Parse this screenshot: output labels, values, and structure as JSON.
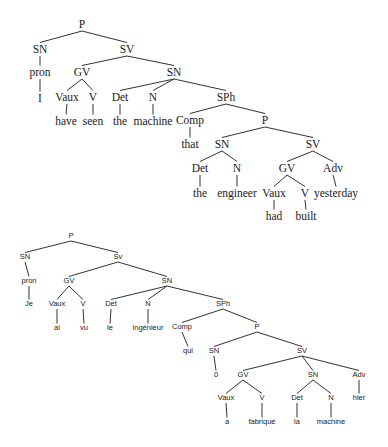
{
  "trees": [
    {
      "id": "english",
      "style": "t1",
      "sentence": "I have seen the machine that the engineer had built yesterday",
      "nodes": [
        {
          "id": "P",
          "label": "P",
          "x": 82,
          "y": 28
        },
        {
          "id": "SN1",
          "label": "SN",
          "x": 40,
          "y": 53
        },
        {
          "id": "SV1",
          "label": "SV",
          "x": 127,
          "y": 53
        },
        {
          "id": "pron",
          "label": "pron",
          "x": 40,
          "y": 76
        },
        {
          "id": "I",
          "label": "I",
          "x": 40,
          "y": 102
        },
        {
          "id": "GV1",
          "label": "GV",
          "x": 82,
          "y": 76
        },
        {
          "id": "SN2",
          "label": "SN",
          "x": 174,
          "y": 76
        },
        {
          "id": "Vaux1",
          "label": "Vaux",
          "x": 67,
          "y": 101
        },
        {
          "id": "V1",
          "label": "V",
          "x": 93,
          "y": 101
        },
        {
          "id": "Det1",
          "label": "Det",
          "x": 120,
          "y": 101
        },
        {
          "id": "N1",
          "label": "N",
          "x": 153,
          "y": 101
        },
        {
          "id": "SPh",
          "label": "SPh",
          "x": 226,
          "y": 101
        },
        {
          "id": "have",
          "label": "have",
          "x": 66,
          "y": 125
        },
        {
          "id": "seen",
          "label": "seen",
          "x": 93,
          "y": 125
        },
        {
          "id": "the1",
          "label": "the",
          "x": 120,
          "y": 125
        },
        {
          "id": "machine",
          "label": "machine",
          "x": 153,
          "y": 125
        },
        {
          "id": "Comp",
          "label": "Comp",
          "x": 190,
          "y": 124
        },
        {
          "id": "P2",
          "label": "P",
          "x": 265,
          "y": 124
        },
        {
          "id": "that",
          "label": "that",
          "x": 190,
          "y": 148
        },
        {
          "id": "SN3",
          "label": "SN",
          "x": 222,
          "y": 148
        },
        {
          "id": "SV2",
          "label": "SV",
          "x": 313,
          "y": 148
        },
        {
          "id": "Det2",
          "label": "Det",
          "x": 200,
          "y": 172
        },
        {
          "id": "N2",
          "label": "N",
          "x": 237,
          "y": 172
        },
        {
          "id": "GV2",
          "label": "GV",
          "x": 287,
          "y": 172
        },
        {
          "id": "Adv",
          "label": "Adv",
          "x": 333,
          "y": 172
        },
        {
          "id": "the2",
          "label": "the",
          "x": 200,
          "y": 197
        },
        {
          "id": "engineer",
          "label": "engineer",
          "x": 237,
          "y": 197
        },
        {
          "id": "Vaux2",
          "label": "Vaux",
          "x": 274,
          "y": 197
        },
        {
          "id": "V2",
          "label": "V",
          "x": 305,
          "y": 197
        },
        {
          "id": "yesterday",
          "label": "yesterday",
          "x": 336,
          "y": 197
        },
        {
          "id": "had",
          "label": "had",
          "x": 274,
          "y": 220
        },
        {
          "id": "built",
          "label": "built",
          "x": 306,
          "y": 220
        }
      ],
      "edges": [
        [
          "P",
          "SN1"
        ],
        [
          "P",
          "SV1"
        ],
        [
          "SN1",
          "pron"
        ],
        [
          "pron",
          "I"
        ],
        [
          "SV1",
          "GV1"
        ],
        [
          "SV1",
          "SN2"
        ],
        [
          "GV1",
          "Vaux1"
        ],
        [
          "GV1",
          "V1"
        ],
        [
          "Vaux1",
          "have"
        ],
        [
          "V1",
          "seen"
        ],
        [
          "SN2",
          "Det1"
        ],
        [
          "SN2",
          "N1"
        ],
        [
          "SN2",
          "SPh"
        ],
        [
          "Det1",
          "the1"
        ],
        [
          "N1",
          "machine"
        ],
        [
          "SPh",
          "Comp"
        ],
        [
          "SPh",
          "P2"
        ],
        [
          "Comp",
          "that"
        ],
        [
          "P2",
          "SN3"
        ],
        [
          "P2",
          "SV2"
        ],
        [
          "SN3",
          "Det2"
        ],
        [
          "SN3",
          "N2"
        ],
        [
          "Det2",
          "the2"
        ],
        [
          "N2",
          "engineer"
        ],
        [
          "SV2",
          "GV2"
        ],
        [
          "SV2",
          "Adv"
        ],
        [
          "GV2",
          "Vaux2"
        ],
        [
          "GV2",
          "V2"
        ],
        [
          "Vaux2",
          "had"
        ],
        [
          "V2",
          "built"
        ],
        [
          "Adv",
          "yesterday"
        ]
      ]
    },
    {
      "id": "french",
      "style": "t2",
      "sentence": "Je ai vu le ingénieur qui 0 a fabriqué la machine hier",
      "nodes": [
        {
          "id": "P",
          "label": "P",
          "x": 71,
          "y": 238
        },
        {
          "id": "SN1",
          "label": "SN",
          "x": 25,
          "y": 259
        },
        {
          "id": "SV1",
          "label": "Sv",
          "x": 118,
          "y": 259
        },
        {
          "id": "pron",
          "label": "pron",
          "x": 29,
          "y": 283
        },
        {
          "id": "GV1",
          "label": "GV",
          "x": 69,
          "y": 283
        },
        {
          "id": "SN2",
          "label": "SN",
          "x": 167,
          "y": 283
        },
        {
          "id": "Je",
          "label": "Je",
          "x": 29,
          "y": 306
        },
        {
          "id": "Vaux1",
          "label": "Vaux",
          "x": 57,
          "y": 306
        },
        {
          "id": "V1",
          "label": "V",
          "x": 83,
          "y": 306
        },
        {
          "id": "Det1",
          "label": "Det",
          "x": 111,
          "y": 306
        },
        {
          "id": "N1",
          "label": "N",
          "x": 148,
          "y": 306
        },
        {
          "id": "SPh",
          "label": "SPh",
          "x": 223,
          "y": 306
        },
        {
          "id": "ai",
          "label": "ai",
          "x": 57,
          "y": 330
        },
        {
          "id": "vu",
          "label": "vu",
          "x": 84,
          "y": 330
        },
        {
          "id": "le",
          "label": "le",
          "x": 110,
          "y": 330
        },
        {
          "id": "ingenieur",
          "label": "ingénieur",
          "x": 148,
          "y": 330
        },
        {
          "id": "Comp",
          "label": "Comp",
          "x": 182,
          "y": 329
        },
        {
          "id": "P2",
          "label": "P",
          "x": 257,
          "y": 329
        },
        {
          "id": "qui",
          "label": "qui",
          "x": 188,
          "y": 353
        },
        {
          "id": "SN3",
          "label": "SN",
          "x": 214,
          "y": 353
        },
        {
          "id": "SV2",
          "label": "SV",
          "x": 302,
          "y": 353
        },
        {
          "id": "zero",
          "label": "0",
          "x": 216,
          "y": 377
        },
        {
          "id": "GV2",
          "label": "GV",
          "x": 243,
          "y": 377
        },
        {
          "id": "SN4",
          "label": "SN",
          "x": 313,
          "y": 377
        },
        {
          "id": "Adv",
          "label": "Adv",
          "x": 359,
          "y": 377
        },
        {
          "id": "Vaux2",
          "label": "Vaux",
          "x": 226,
          "y": 400
        },
        {
          "id": "V2",
          "label": "V",
          "x": 262,
          "y": 400
        },
        {
          "id": "Det2",
          "label": "Det",
          "x": 297,
          "y": 400
        },
        {
          "id": "N2",
          "label": "N",
          "x": 331,
          "y": 400
        },
        {
          "id": "hier",
          "label": "hier",
          "x": 359,
          "y": 400
        },
        {
          "id": "a",
          "label": "a",
          "x": 227,
          "y": 424
        },
        {
          "id": "fabrique",
          "label": "fabriqué",
          "x": 262,
          "y": 424
        },
        {
          "id": "la",
          "label": "la",
          "x": 297,
          "y": 424
        },
        {
          "id": "machine",
          "label": "machine",
          "x": 331,
          "y": 424
        }
      ],
      "edges": [
        [
          "P",
          "SN1"
        ],
        [
          "P",
          "SV1"
        ],
        [
          "SN1",
          "pron"
        ],
        [
          "pron",
          "Je"
        ],
        [
          "SV1",
          "GV1"
        ],
        [
          "SV1",
          "SN2"
        ],
        [
          "GV1",
          "Vaux1"
        ],
        [
          "GV1",
          "V1"
        ],
        [
          "Vaux1",
          "ai"
        ],
        [
          "V1",
          "vu"
        ],
        [
          "SN2",
          "Det1"
        ],
        [
          "SN2",
          "N1"
        ],
        [
          "SN2",
          "SPh"
        ],
        [
          "Det1",
          "le"
        ],
        [
          "N1",
          "ingenieur"
        ],
        [
          "SPh",
          "Comp"
        ],
        [
          "SPh",
          "P2"
        ],
        [
          "Comp",
          "qui"
        ],
        [
          "P2",
          "SN3"
        ],
        [
          "P2",
          "SV2"
        ],
        [
          "SN3",
          "zero"
        ],
        [
          "SV2",
          "GV2"
        ],
        [
          "SV2",
          "SN4"
        ],
        [
          "SV2",
          "Adv"
        ],
        [
          "GV2",
          "Vaux2"
        ],
        [
          "GV2",
          "V2"
        ],
        [
          "Vaux2",
          "a"
        ],
        [
          "V2",
          "fabrique"
        ],
        [
          "SN4",
          "Det2"
        ],
        [
          "SN4",
          "N2"
        ],
        [
          "Det2",
          "la"
        ],
        [
          "N2",
          "machine"
        ],
        [
          "Adv",
          "hier"
        ]
      ]
    }
  ]
}
